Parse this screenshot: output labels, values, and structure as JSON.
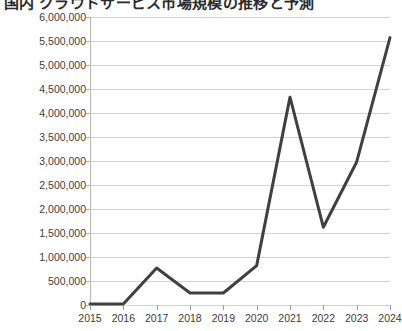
{
  "title": {
    "text": "国内 クラウドサービス市場規模の推移と予測",
    "visible_note": "cut off at top edge"
  },
  "chart_data": {
    "type": "line",
    "title": "国内 クラウドサービス市場規模の推移と予測",
    "xlabel": "",
    "ylabel": "",
    "categories": [
      "2015",
      "2016",
      "2017",
      "2018",
      "2019",
      "2020",
      "2021",
      "2022",
      "2023",
      "2024"
    ],
    "values": [
      20000,
      20000,
      770000,
      250000,
      250000,
      820000,
      4330000,
      1620000,
      2980000,
      5570000
    ],
    "series": [
      {
        "name": "市場規模",
        "values": [
          20000,
          20000,
          770000,
          250000,
          250000,
          820000,
          4330000,
          1620000,
          2980000,
          5570000
        ]
      }
    ],
    "ylim": [
      0,
      6000000
    ],
    "ytick_values": [
      0,
      500000,
      1000000,
      1500000,
      2000000,
      2500000,
      3000000,
      3500000,
      4000000,
      4500000,
      5000000,
      5500000,
      6000000
    ],
    "ytick_labels": [
      "0",
      "500,000",
      "1,000,000",
      "1,500,000",
      "2,000,000",
      "2,500,000",
      "3,000,000",
      "3,500,000",
      "4,000,000",
      "4,500,000",
      "5,000,000",
      "5,500,000",
      "6,000,000"
    ],
    "xtick_labels": [
      "2015",
      "2016",
      "2017",
      "2018",
      "2019",
      "2020",
      "2021",
      "2022",
      "2023",
      "2024"
    ],
    "grid": true,
    "grid_axis": "y",
    "legend": false,
    "legend_position": "none",
    "line_color": "#404040",
    "line_width": 3,
    "background_color": "#ffffff",
    "gridline_color": "#d2d2d2",
    "axis_color": "#9a9a9a",
    "tick_label_color": "#3c3c3c",
    "markers": false
  }
}
